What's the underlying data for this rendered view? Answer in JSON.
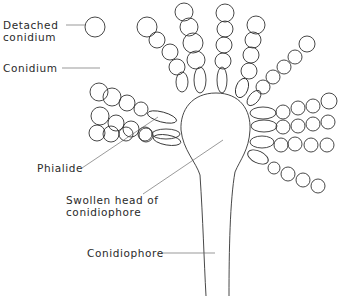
{
  "diagram": {
    "labels": {
      "detached_conidium_line1": "Detached",
      "detached_conidium_line2": "conidium",
      "conidium": "Conidium",
      "phialide": "Phialide",
      "swollen_head_line1": "Swollen head of",
      "swollen_head_line2": "conidiophore",
      "conidiophore": "Conidiophore"
    }
  }
}
